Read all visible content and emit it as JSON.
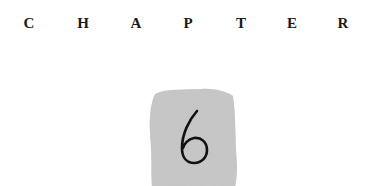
{
  "heading": {
    "label": "CHAPTER",
    "letters": [
      "C",
      "H",
      "A",
      "P",
      "T",
      "E",
      "R"
    ]
  },
  "chapter_number": "6",
  "colors": {
    "text": "#1a1a1a",
    "block": "#c4c4c4"
  }
}
